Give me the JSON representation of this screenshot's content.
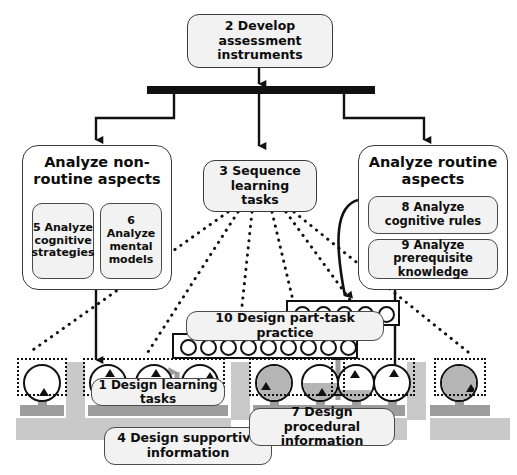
{
  "diagram": {
    "type": "flow-diagram"
  },
  "nodes": {
    "develop_assessment": "2 Develop assessment instruments",
    "analyze_nonroutine": "Analyze non-routine aspects",
    "analyze_cognitive_strategies": "5 Analyze cognitive strategies",
    "analyze_mental_models": "6 Analyze mental models",
    "sequence_learning_tasks": "3 Sequence learning tasks",
    "analyze_routine": "Analyze routine aspects",
    "analyze_cognitive_rules": "8 Analyze cognitive rules",
    "analyze_prerequisite_knowledge": "9 Analyze prerequisite knowledge",
    "design_part_task_practice": "10 Design part-task practice",
    "design_learning_tasks": "1 Design learning tasks",
    "design_supportive_information": "4 Design supportive information",
    "design_procedural_information": "7 Design procedural information"
  },
  "colors": {
    "outline": "#111111",
    "box_fill": "#f2f2f2",
    "panel_fill": "#ffffff",
    "gray_band": "#c9c9c9",
    "gray_stem": "#9d9d9d",
    "task_fill": "#b5b5b5",
    "bar_black": "#111111"
  },
  "practice_strips": [
    {
      "name": "upper-strip",
      "circles": 5
    },
    {
      "name": "lower-strip",
      "circles": 9
    }
  ],
  "learning_tasks": [
    {
      "index": 1,
      "fill_percent": 0,
      "triangle": "bottom"
    },
    {
      "index": 2,
      "fill_percent": 0,
      "triangle": "top"
    },
    {
      "index": 3,
      "fill_percent": 0,
      "triangle": "top"
    },
    {
      "index": 4,
      "fill_percent": 0,
      "triangle": "top"
    },
    {
      "index": 5,
      "fill_percent": 100,
      "triangle": "left"
    },
    {
      "index": 6,
      "fill_percent": 50,
      "triangle": "bottom"
    },
    {
      "index": 7,
      "fill_percent": 30,
      "triangle": "top"
    },
    {
      "index": 8,
      "fill_percent": 0,
      "triangle": "top"
    },
    {
      "index": 9,
      "fill_percent": 100,
      "triangle": "right"
    }
  ],
  "task_groups": [
    {
      "name": "group-1",
      "tasks": 1
    },
    {
      "name": "group-2",
      "tasks": 3
    },
    {
      "name": "group-3",
      "tasks": 2
    },
    {
      "name": "group-4",
      "tasks": 2
    },
    {
      "name": "group-5",
      "tasks": 1
    }
  ]
}
